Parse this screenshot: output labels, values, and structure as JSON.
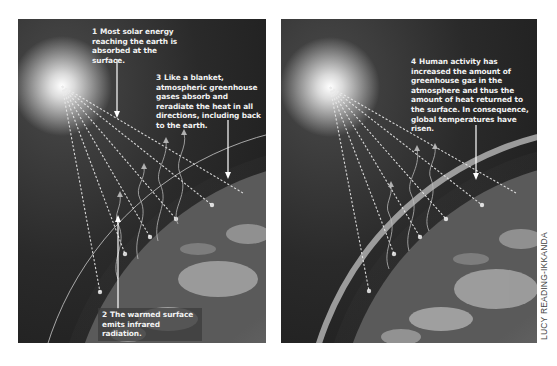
{
  "panels": {
    "left": {
      "title": "Natural greenhouse effect",
      "labels": {
        "l1": {
          "num": "1",
          "text": "Most solar energy reaching the earth is absorbed at the surface."
        },
        "l2": {
          "num": "2",
          "text": "The warmed surface emits infrared radiation."
        },
        "l3": {
          "num": "3",
          "text": "Like a blanket, atmospheric greenhouse gases absorb and reradiate the heat in all directions, including back to the earth."
        }
      }
    },
    "right": {
      "title": "Enhanced greenhouse effect",
      "labels": {
        "l4": {
          "num": "4",
          "text": "Human activity has increased the amount of greenhouse gas in the atmosphere and thus the amount of heat returned to the surface. In consequence, global temperatures have risen."
        }
      }
    }
  },
  "credit": "LUCY READING-IKKANDA",
  "colors": {
    "sky_dark": "#1e1e1e",
    "sky_mid": "#3a3a3a",
    "earth": "#8a8a8a",
    "atmosphere_line": "#c8c8c8",
    "text": "#f2f2f2"
  }
}
